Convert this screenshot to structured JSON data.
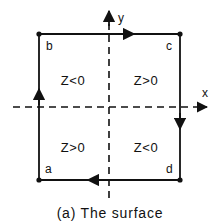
{
  "figure": {
    "caption": "(a) The surface",
    "colors": {
      "stroke": "#111111",
      "background": "#ffffff"
    },
    "axes": {
      "x_label": "x",
      "y_label": "y",
      "style": "dashed",
      "origin_x": 109,
      "origin_y": 107
    },
    "contour": {
      "style": "solid",
      "vertices": [
        {
          "id": "b",
          "label": "b",
          "corner": "top-left",
          "x": 39,
          "y": 34
        },
        {
          "id": "c",
          "label": "c",
          "corner": "top-right",
          "x": 180,
          "y": 34
        },
        {
          "id": "d",
          "label": "d",
          "corner": "bottom-right",
          "x": 180,
          "y": 180
        },
        {
          "id": "a",
          "label": "a",
          "corner": "bottom-left",
          "x": 39,
          "y": 180
        }
      ],
      "edge_arrows": [
        {
          "edge": "top",
          "direction": "right",
          "x": 133,
          "y": 34
        },
        {
          "edge": "right",
          "direction": "down",
          "x": 180,
          "y": 128
        },
        {
          "edge": "bottom",
          "direction": "left",
          "x": 88,
          "y": 180
        },
        {
          "edge": "left",
          "direction": "up",
          "x": 39,
          "y": 90
        }
      ]
    },
    "quadrants": [
      {
        "position": "top-left",
        "label": "Z<0",
        "x": 73,
        "y": 81
      },
      {
        "position": "top-right",
        "label": "Z>0",
        "x": 145,
        "y": 81
      },
      {
        "position": "bottom-left",
        "label": "Z>0",
        "x": 73,
        "y": 148
      },
      {
        "position": "bottom-right",
        "label": "Z<0",
        "x": 145,
        "y": 148
      }
    ]
  }
}
